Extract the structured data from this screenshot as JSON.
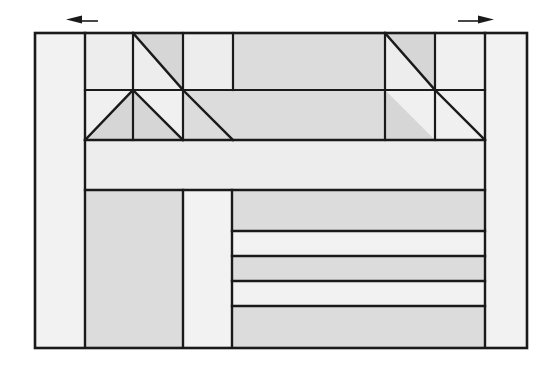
{
  "document": {
    "title": "Structural Truss and Wall Assembly Diagram",
    "kind": "line-drawing",
    "background_color": "#ffffff",
    "canvas": {
      "width": 560,
      "height": 369
    }
  },
  "palette": {
    "outline": "#1a1a1a",
    "fill_very_light": "#f2f2f2",
    "fill_light": "#ededed",
    "fill_mid": "#dcdcdc",
    "fill_dark": "#d2d2d2",
    "white": "#ffffff"
  },
  "geometry": {
    "frame": {
      "x": 35,
      "y": 33,
      "width": 492,
      "height": 315
    },
    "vertical_guides": [
      85,
      133,
      183,
      233,
      385,
      435,
      485
    ],
    "horizontal_guides": [
      33,
      90,
      140,
      190,
      231,
      256,
      281,
      306,
      347
    ],
    "stroke_width_outer": 2.6,
    "stroke_width_inner": 2.2
  },
  "markers": {
    "left_arrow": {
      "name": "direction-arrow-left",
      "direction": "left",
      "tail_x": 98,
      "head_x": 68,
      "y": 21,
      "label": ""
    },
    "right_arrow": {
      "name": "direction-arrow-right",
      "direction": "right",
      "tail_x": 458,
      "head_x": 492,
      "y": 21,
      "label": ""
    }
  },
  "regions": {
    "left_column": {
      "label": "left-edge-column",
      "x": 35,
      "y": 33,
      "w": 50,
      "h": 315,
      "fill": "#f2f2f2"
    },
    "right_column": {
      "label": "right-edge-column",
      "x": 485,
      "y": 33,
      "w": 42,
      "h": 315,
      "fill": "#f2f2f2"
    },
    "truss_upper_band": {
      "label": "truss-upper-chord-band",
      "y": 33,
      "h": 57
    },
    "truss_lower_band": {
      "label": "truss-lower-chord-band",
      "y": 90,
      "h": 50
    },
    "mid_band": {
      "label": "mid-horizontal-band",
      "x": 85,
      "y": 140,
      "w": 400,
      "h": 50,
      "fill": "#ededed"
    },
    "lower_left_block": {
      "label": "lower-left-panel",
      "x": 85,
      "y": 190,
      "w": 98,
      "h": 157,
      "fill": "#dcdcdc"
    },
    "lower_mid_block": {
      "label": "lower-middle-panel",
      "x": 183,
      "y": 190,
      "w": 49,
      "h": 157,
      "fill": "#f2f2f2"
    }
  },
  "truss_cells_upper": [
    {
      "name": "cell-u1",
      "x": 85,
      "w": 48,
      "fill": "#ededed",
      "diagonal": "none"
    },
    {
      "name": "cell-u2",
      "x": 133,
      "w": 50,
      "fill": "#dcdcdc",
      "diagonal": "tl-br"
    },
    {
      "name": "cell-u3",
      "x": 183,
      "w": 50,
      "fill": "#ededed",
      "diagonal": "none"
    },
    {
      "name": "cell-u4",
      "x": 233,
      "w": 152,
      "fill": "#dcdcdc",
      "diagonal": "none"
    },
    {
      "name": "cell-u5",
      "x": 385,
      "w": 50,
      "fill": "#dcdcdc",
      "diagonal": "tl-br"
    },
    {
      "name": "cell-u6",
      "x": 435,
      "w": 50,
      "fill": "#ededed",
      "diagonal": "none"
    }
  ],
  "truss_cells_lower": [
    {
      "name": "cell-l1",
      "x": 85,
      "w": 48,
      "fill": "#ededed",
      "diagonal": "bl-tr"
    },
    {
      "name": "cell-l2",
      "x": 133,
      "w": 50,
      "fill": "#dcdcdc",
      "diagonal": "tl-br"
    },
    {
      "name": "cell-l3",
      "x": 183,
      "w": 50,
      "fill": "#ededed",
      "diagonal": "none"
    },
    {
      "name": "cell-l4",
      "x": 233,
      "w": 152,
      "fill": "#dcdcdc",
      "diagonal": "none"
    },
    {
      "name": "cell-l5",
      "x": 385,
      "w": 50,
      "fill": "#dcdcdc",
      "diagonal": "tl-br"
    },
    {
      "name": "cell-l6",
      "x": 435,
      "w": 50,
      "fill": "#ededed",
      "diagonal": "none"
    }
  ],
  "stripes": [
    {
      "name": "stripe-1",
      "y": 190,
      "h": 41,
      "fill": "#dcdcdc"
    },
    {
      "name": "stripe-2",
      "y": 231,
      "h": 25,
      "fill": "#f2f2f2"
    },
    {
      "name": "stripe-3",
      "y": 256,
      "h": 25,
      "fill": "#dcdcdc"
    },
    {
      "name": "stripe-4",
      "y": 281,
      "h": 25,
      "fill": "#f2f2f2"
    },
    {
      "name": "stripe-5",
      "y": 306,
      "h": 41,
      "fill": "#dcdcdc"
    }
  ],
  "stripe_region": {
    "x": 232,
    "w": 253
  },
  "annotations": {
    "caption": "",
    "notes": ""
  }
}
